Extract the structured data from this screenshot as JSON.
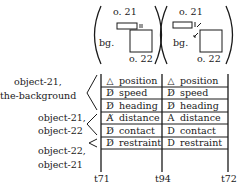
{
  "scenes": [
    {
      "top_label": "o. 21",
      "left_label": "bg.",
      "bottom_label": "o. 22",
      "contact_mark": "||"
    },
    {
      "top_label": "o. 21",
      "left_label": "bg.",
      "bottom_label": "o. 22",
      "contact_mark": "↙"
    }
  ],
  "row_groups": [
    {
      "line1": "object-21,",
      "line2": "the-background"
    },
    {
      "line1": "object-21,",
      "line2": "object-22"
    },
    {
      "line1": "object-22,",
      "line2": "object-21"
    }
  ],
  "columns": [
    {
      "rows": [
        {
          "symbol": "△",
          "label": "position"
        },
        {
          "symbol": "D̸",
          "label": "speed"
        },
        {
          "symbol": "D̸",
          "label": "heading"
        },
        {
          "symbol": "A̸",
          "label": "distance"
        },
        {
          "symbol": "D̸",
          "label": "contact"
        },
        {
          "symbol": "D̸",
          "label": "restraint"
        }
      ]
    },
    {
      "rows": [
        {
          "symbol": "△",
          "label": "position"
        },
        {
          "symbol": "D̸",
          "label": "speed"
        },
        {
          "symbol": "D̸",
          "label": "heading"
        },
        {
          "symbol": "A",
          "label": "distance"
        },
        {
          "symbol": "D",
          "label": "contact"
        },
        {
          "symbol": "D",
          "label": "restraint"
        }
      ]
    }
  ],
  "time_labels": [
    "t71",
    "t94",
    "t72"
  ]
}
